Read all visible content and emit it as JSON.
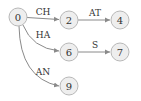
{
  "diagram": {
    "type": "trie",
    "nodes": [
      {
        "id": "0",
        "label": "0",
        "x": 18,
        "y": 17
      },
      {
        "id": "2",
        "label": "2",
        "x": 69,
        "y": 20
      },
      {
        "id": "4",
        "label": "4",
        "x": 120,
        "y": 20
      },
      {
        "id": "6",
        "label": "6",
        "x": 69,
        "y": 52
      },
      {
        "id": "7",
        "label": "7",
        "x": 120,
        "y": 52
      },
      {
        "id": "9",
        "label": "9",
        "x": 69,
        "y": 86
      }
    ],
    "edges": [
      {
        "from": "0",
        "to": "2",
        "label": "CH"
      },
      {
        "from": "2",
        "to": "4",
        "label": "AT"
      },
      {
        "from": "0",
        "to": "6",
        "label": "HA"
      },
      {
        "from": "6",
        "to": "7",
        "label": "S"
      },
      {
        "from": "0",
        "to": "9",
        "label": "AN"
      }
    ]
  }
}
